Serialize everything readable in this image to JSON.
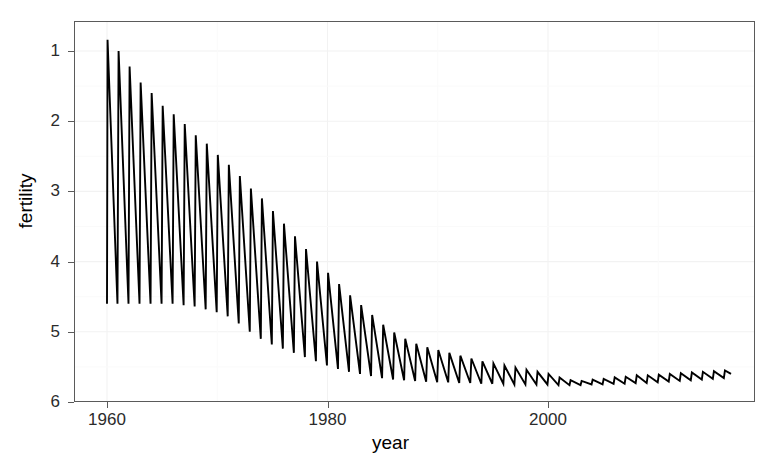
{
  "chart_data": {
    "type": "line",
    "title": "",
    "xlabel": "year",
    "ylabel": "fertility",
    "xlim": [
      1959.5,
      2017.5
    ],
    "ylim": [
      1.0,
      6.4
    ],
    "xticks": [
      1960,
      1980,
      2000
    ],
    "yticks": [
      1,
      2,
      3,
      4,
      5,
      6
    ],
    "grid": true,
    "legend": "none",
    "series_name": "fertility",
    "line_color": "#000000",
    "x": [
      1960.0,
      1960.08,
      1960.17,
      1960.25,
      1960.33,
      1960.42,
      1960.5,
      1960.58,
      1960.67,
      1960.75,
      1960.83,
      1960.92,
      1961.0,
      1961.08,
      1961.17,
      1961.25,
      1961.33,
      1961.42,
      1961.5,
      1961.58,
      1961.67,
      1961.75,
      1961.83,
      1961.92,
      1962.0,
      1963.0,
      1964.0,
      1965.0,
      1966.0,
      1967.0,
      1968.0,
      1969.0,
      1970.0,
      1971.0,
      1972.0,
      1973.0,
      1974.0,
      1975.0,
      1976.0,
      1977.0,
      1978.0,
      1979.0,
      1980.0,
      1981.0,
      1982.0,
      1983.0,
      1984.0,
      1985.0,
      1986.0,
      1987.0,
      1988.0,
      1989.0,
      1990.0,
      1991.0,
      1992.0,
      1993.0,
      1994.0,
      1995.0,
      1996.0,
      1997.0,
      1998.0,
      1999.0,
      2000.0,
      2001.0,
      2002.0,
      2003.0,
      2004.0,
      2005.0,
      2006.0,
      2007.0,
      2008.0,
      2009.0,
      2010.0,
      2011.0,
      2012.0,
      2013.0,
      2014.0,
      2015.0,
      2016.0
    ],
    "peaks": [
      {
        "year": 1960.05,
        "value": 6.16
      },
      {
        "year": 1961.05,
        "value": 6.0
      },
      {
        "year": 1962.05,
        "value": 5.78
      },
      {
        "year": 1963.05,
        "value": 5.55
      },
      {
        "year": 1964.05,
        "value": 5.4
      },
      {
        "year": 1965.05,
        "value": 5.22
      },
      {
        "year": 1966.05,
        "value": 5.1
      },
      {
        "year": 1967.05,
        "value": 4.96
      },
      {
        "year": 1968.05,
        "value": 4.8
      },
      {
        "year": 1969.05,
        "value": 4.68
      },
      {
        "year": 1970.05,
        "value": 4.52
      },
      {
        "year": 1971.05,
        "value": 4.38
      },
      {
        "year": 1972.05,
        "value": 4.22
      },
      {
        "year": 1973.05,
        "value": 4.04
      },
      {
        "year": 1974.05,
        "value": 3.9
      },
      {
        "year": 1975.05,
        "value": 3.72
      },
      {
        "year": 1976.05,
        "value": 3.54
      },
      {
        "year": 1977.05,
        "value": 3.36
      },
      {
        "year": 1978.05,
        "value": 3.18
      },
      {
        "year": 1979.05,
        "value": 3.0
      },
      {
        "year": 1980.05,
        "value": 2.84
      },
      {
        "year": 1981.05,
        "value": 2.68
      },
      {
        "year": 1982.05,
        "value": 2.52
      },
      {
        "year": 1983.05,
        "value": 2.38
      },
      {
        "year": 1984.05,
        "value": 2.24
      },
      {
        "year": 1985.05,
        "value": 2.1
      },
      {
        "year": 1986.05,
        "value": 1.99
      },
      {
        "year": 1987.05,
        "value": 1.9
      },
      {
        "year": 1988.05,
        "value": 1.83
      },
      {
        "year": 1989.05,
        "value": 1.78
      },
      {
        "year": 1990.05,
        "value": 1.74
      },
      {
        "year": 1991.05,
        "value": 1.7
      },
      {
        "year": 1992.05,
        "value": 1.66
      },
      {
        "year": 1993.05,
        "value": 1.62
      },
      {
        "year": 1994.05,
        "value": 1.58
      },
      {
        "year": 1995.05,
        "value": 1.55
      },
      {
        "year": 1996.05,
        "value": 1.52
      },
      {
        "year": 1997.05,
        "value": 1.49
      },
      {
        "year": 1998.05,
        "value": 1.46
      },
      {
        "year": 1999.05,
        "value": 1.43
      },
      {
        "year": 2000.05,
        "value": 1.4
      },
      {
        "year": 2001.05,
        "value": 1.35
      },
      {
        "year": 2002.05,
        "value": 1.31
      },
      {
        "year": 2003.05,
        "value": 1.3
      },
      {
        "year": 2004.05,
        "value": 1.32
      },
      {
        "year": 2005.05,
        "value": 1.33
      },
      {
        "year": 2006.05,
        "value": 1.35
      },
      {
        "year": 2007.05,
        "value": 1.36
      },
      {
        "year": 2008.05,
        "value": 1.38
      },
      {
        "year": 2009.05,
        "value": 1.38
      },
      {
        "year": 2010.05,
        "value": 1.39
      },
      {
        "year": 2011.05,
        "value": 1.4
      },
      {
        "year": 2012.05,
        "value": 1.41
      },
      {
        "year": 2013.05,
        "value": 1.42
      },
      {
        "year": 2014.05,
        "value": 1.43
      },
      {
        "year": 2015.05,
        "value": 1.44
      },
      {
        "year": 2016.05,
        "value": 1.45
      }
    ],
    "troughs": [
      {
        "year": 1960.0,
        "value": 2.4
      },
      {
        "year": 1960.95,
        "value": 2.4
      },
      {
        "year": 1961.95,
        "value": 2.4
      },
      {
        "year": 1962.95,
        "value": 2.4
      },
      {
        "year": 1963.95,
        "value": 2.4
      },
      {
        "year": 1964.95,
        "value": 2.4
      },
      {
        "year": 1965.95,
        "value": 2.4
      },
      {
        "year": 1966.95,
        "value": 2.38
      },
      {
        "year": 1967.95,
        "value": 2.36
      },
      {
        "year": 1968.95,
        "value": 2.32
      },
      {
        "year": 1969.95,
        "value": 2.28
      },
      {
        "year": 1970.95,
        "value": 2.22
      },
      {
        "year": 1971.95,
        "value": 2.12
      },
      {
        "year": 1972.95,
        "value": 2.0
      },
      {
        "year": 1973.95,
        "value": 1.9
      },
      {
        "year": 1974.95,
        "value": 1.82
      },
      {
        "year": 1975.95,
        "value": 1.76
      },
      {
        "year": 1976.95,
        "value": 1.7
      },
      {
        "year": 1977.95,
        "value": 1.64
      },
      {
        "year": 1978.95,
        "value": 1.58
      },
      {
        "year": 1979.95,
        "value": 1.52
      },
      {
        "year": 1980.95,
        "value": 1.47
      },
      {
        "year": 1981.95,
        "value": 1.43
      },
      {
        "year": 1982.95,
        "value": 1.4
      },
      {
        "year": 1983.95,
        "value": 1.37
      },
      {
        "year": 1984.95,
        "value": 1.34
      },
      {
        "year": 1985.95,
        "value": 1.32
      },
      {
        "year": 1986.95,
        "value": 1.31
      },
      {
        "year": 1987.95,
        "value": 1.3
      },
      {
        "year": 1988.95,
        "value": 1.29
      },
      {
        "year": 1989.95,
        "value": 1.28
      },
      {
        "year": 1990.95,
        "value": 1.28
      },
      {
        "year": 1991.95,
        "value": 1.27
      },
      {
        "year": 1992.95,
        "value": 1.27
      },
      {
        "year": 1993.95,
        "value": 1.26
      },
      {
        "year": 1994.95,
        "value": 1.26
      },
      {
        "year": 1995.95,
        "value": 1.26
      },
      {
        "year": 1996.95,
        "value": 1.25
      },
      {
        "year": 1997.95,
        "value": 1.25
      },
      {
        "year": 1998.95,
        "value": 1.25
      },
      {
        "year": 1999.95,
        "value": 1.25
      },
      {
        "year": 2000.95,
        "value": 1.24
      },
      {
        "year": 2001.95,
        "value": 1.24
      },
      {
        "year": 2002.95,
        "value": 1.24
      },
      {
        "year": 2003.95,
        "value": 1.25
      },
      {
        "year": 2004.95,
        "value": 1.25
      },
      {
        "year": 2005.95,
        "value": 1.26
      },
      {
        "year": 2006.95,
        "value": 1.26
      },
      {
        "year": 2007.95,
        "value": 1.27
      },
      {
        "year": 2008.95,
        "value": 1.27
      },
      {
        "year": 2009.95,
        "value": 1.28
      },
      {
        "year": 2010.95,
        "value": 1.29
      },
      {
        "year": 2011.95,
        "value": 1.3
      },
      {
        "year": 2012.95,
        "value": 1.31
      },
      {
        "year": 2013.95,
        "value": 1.32
      },
      {
        "year": 2014.95,
        "value": 1.33
      },
      {
        "year": 2015.95,
        "value": 1.34
      },
      {
        "year": 2016.6,
        "value": 1.4
      }
    ]
  },
  "axes": {
    "x": {
      "title": "year",
      "ticks": [
        {
          "label": "1960",
          "value": 1960
        },
        {
          "label": "1980",
          "value": 1980
        },
        {
          "label": "2000",
          "value": 2000
        }
      ]
    },
    "y": {
      "title": "fertility",
      "ticks": [
        {
          "label": "6",
          "value": 6
        },
        {
          "label": "5",
          "value": 5
        },
        {
          "label": "4",
          "value": 4
        },
        {
          "label": "3",
          "value": 3
        },
        {
          "label": "2",
          "value": 2
        },
        {
          "label": "1",
          "value": 1
        }
      ]
    }
  },
  "style": {
    "panel_background": "#ffffff",
    "panel_border": "#5a5a5a",
    "grid_color": "#f2f2f2",
    "line_color": "#000000",
    "text_color": "#2b2b2b"
  }
}
